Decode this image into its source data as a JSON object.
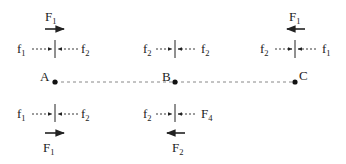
{
  "diagram": {
    "points": [
      {
        "id": "A",
        "label": "A",
        "x": 55,
        "y": 82
      },
      {
        "id": "B",
        "label": "B",
        "x": 175,
        "y": 82
      },
      {
        "id": "C",
        "label": "C",
        "x": 295,
        "y": 82
      }
    ],
    "baseline": {
      "style": "dashed",
      "from": "A",
      "to": "C"
    },
    "top": {
      "A": {
        "force": {
          "base": "F",
          "sub": "1",
          "direction": "right"
        },
        "left": {
          "base": "f",
          "sub": "1"
        },
        "right": {
          "base": "f",
          "sub": "2"
        }
      },
      "B": {
        "left": {
          "base": "f",
          "sub": "2"
        },
        "right": {
          "base": "f",
          "sub": "2"
        }
      },
      "C": {
        "force": {
          "base": "F",
          "sub": "1",
          "direction": "left"
        },
        "left": {
          "base": "f",
          "sub": "2"
        },
        "right": {
          "base": "f",
          "sub": "1"
        }
      }
    },
    "bottom": {
      "A": {
        "force": {
          "base": "F",
          "sub": "1",
          "direction": "right"
        },
        "left": {
          "base": "f",
          "sub": "1"
        },
        "right": {
          "base": "f",
          "sub": "2"
        }
      },
      "B": {
        "force": {
          "base": "F",
          "sub": "2",
          "direction": "left"
        },
        "left": {
          "base": "f",
          "sub": "2"
        },
        "right": {
          "base": "F",
          "sub": "4"
        }
      }
    },
    "colors": {
      "ink": "#222222",
      "dash": "#888888",
      "background": "#ffffff"
    }
  }
}
